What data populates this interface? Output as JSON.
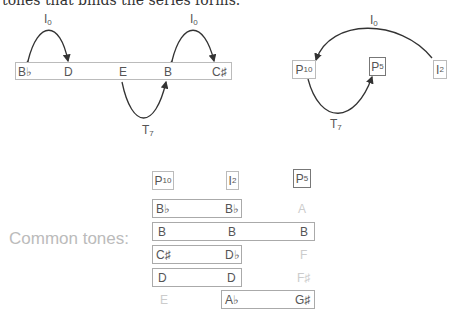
{
  "top_text": "tones that binds the series forms.",
  "left_diagram": {
    "notes": [
      "B♭",
      "D",
      "E",
      "B",
      "C♯"
    ],
    "arcs": [
      {
        "label": "I",
        "sub": "0",
        "from": "D",
        "to": "B♭",
        "bidirectional": true
      },
      {
        "label": "I",
        "sub": "0",
        "from": "B",
        "to": "C♯",
        "bidirectional": true
      },
      {
        "label": "T",
        "sub": "7",
        "from": "E",
        "to": "B"
      }
    ]
  },
  "right_diagram": {
    "nodes": [
      {
        "label": "P",
        "sub": "10"
      },
      {
        "label": "P",
        "sub": "5"
      },
      {
        "label": "I",
        "sub": "2"
      }
    ],
    "arcs": [
      {
        "label": "I",
        "sub": "0",
        "from": "I2",
        "to": "P10"
      },
      {
        "label": "T",
        "sub": "7",
        "from": "P10",
        "to": "P5"
      }
    ]
  },
  "common_tones": {
    "label": "Common tones:",
    "headers": [
      {
        "label": "P",
        "sub": "10"
      },
      {
        "label": "I",
        "sub": "2"
      },
      {
        "label": "P",
        "sub": "5"
      }
    ],
    "rows": [
      [
        "B♭",
        "B♭",
        "A"
      ],
      [
        "B",
        "B",
        "B"
      ],
      [
        "C♯",
        "D♭",
        "F"
      ],
      [
        "D",
        "D",
        "F♯"
      ],
      [
        "E",
        "A♭",
        "G♯"
      ]
    ]
  }
}
